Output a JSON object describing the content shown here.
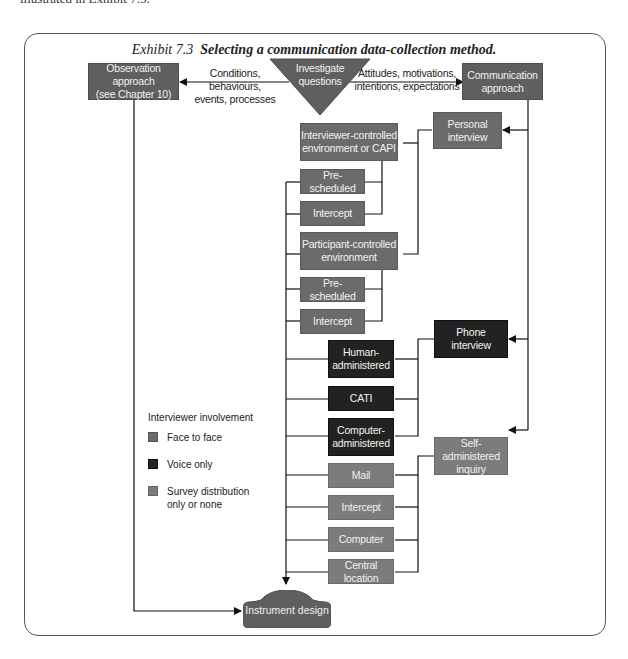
{
  "page": {
    "top_text": "illustrated in Exhibit 7.3."
  },
  "exhibit": {
    "number": "Exhibit 7.3",
    "title": "Selecting a communication data-collection method."
  },
  "nodes": {
    "start": {
      "label": "Investigate questions"
    },
    "observation": {
      "label_1": "Observation approach",
      "label_2": "(see Chapter 10)"
    },
    "communication": {
      "label_1": "Communication",
      "label_2": "approach"
    },
    "personal_interview": {
      "label_1": "Personal",
      "label_2": "interview"
    },
    "phone_interview": {
      "label_1": "Phone",
      "label_2": "interview"
    },
    "self_administered": {
      "label_1": "Self-administered",
      "label_2": "inquiry"
    },
    "interviewer_controlled": {
      "label_1": "Interviewer-controlled",
      "label_2": "environment or CAPI"
    },
    "ic_prescheduled": {
      "label": "Pre-scheduled"
    },
    "ic_intercept": {
      "label": "Intercept"
    },
    "participant_controlled": {
      "label_1": "Participant-controlled",
      "label_2": "environment"
    },
    "pc_prescheduled": {
      "label": "Pre-scheduled"
    },
    "pc_intercept": {
      "label": "Intercept"
    },
    "human_administered": {
      "label_1": "Human-",
      "label_2": "administered"
    },
    "cati": {
      "label": "CATI"
    },
    "computer_administered": {
      "label_1": "Computer-",
      "label_2": "administered"
    },
    "mail": {
      "label": "Mail"
    },
    "sa_intercept": {
      "label": "Intercept"
    },
    "computer": {
      "label": "Computer"
    },
    "central_location": {
      "label": "Central location"
    },
    "instrument_design": {
      "label": "Instrument design"
    }
  },
  "edge_labels": {
    "to_observation_1": "Conditions, behaviours,",
    "to_observation_2": "events, processes",
    "to_communication_1": "Attitudes, motivations,",
    "to_communication_2": "intentions, expectations"
  },
  "legend": {
    "title": "Interviewer involvement",
    "items": [
      {
        "label": "Face to face",
        "color": "#6b6b6b"
      },
      {
        "label": "Voice only",
        "color": "#222222"
      },
      {
        "label_1": "Survey distribution",
        "label_2": "only or none",
        "color": "#7c7c7c"
      }
    ]
  },
  "colors": {
    "face_to_face": "#6b6b6b",
    "voice_only": "#222222",
    "survey_distribution": "#7c7c7c",
    "approach": "#5f5f5f",
    "line": "#111111"
  }
}
